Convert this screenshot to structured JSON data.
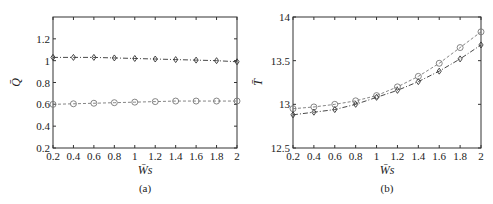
{
  "chart_data": [
    {
      "type": "line",
      "panel": "(a)",
      "caption": "(a)",
      "title": "",
      "xlabel": "W̄s",
      "ylabel": "Q̄",
      "x": [
        0.2,
        0.4,
        0.6,
        0.8,
        1.0,
        1.2,
        1.4,
        1.6,
        1.8,
        2.0
      ],
      "xticks": [
        "0.2",
        "0.4",
        "0.6",
        "0.8",
        "1",
        "1.2",
        "1.4",
        "1.6",
        "1.8",
        "2"
      ],
      "yticks": [
        "0.2",
        "0.4",
        "0.6",
        "0.8",
        "1",
        "1.2"
      ],
      "xlim": [
        0.2,
        2.0
      ],
      "ylim": [
        0.2,
        1.4
      ],
      "grid": false,
      "legend": null,
      "series": [
        {
          "name": "diamond (dash-dot)",
          "marker": "diamond",
          "line": "dash-dot",
          "values": [
            1.03,
            1.03,
            1.03,
            1.025,
            1.02,
            1.015,
            1.01,
            1.005,
            1.0,
            0.99
          ]
        },
        {
          "name": "circle (dashed)",
          "marker": "circle",
          "line": "dashed",
          "values": [
            0.6,
            0.605,
            0.61,
            0.615,
            0.62,
            0.625,
            0.63,
            0.63,
            0.63,
            0.63
          ]
        }
      ]
    },
    {
      "type": "line",
      "panel": "(b)",
      "caption": "(b)",
      "title": "",
      "xlabel": "W̄s",
      "ylabel": "T̄",
      "x": [
        0.2,
        0.4,
        0.6,
        0.8,
        1.0,
        1.2,
        1.4,
        1.6,
        1.8,
        2.0
      ],
      "xticks": [
        "0.2",
        "0.4",
        "0.6",
        "0.8",
        "1",
        "1.2",
        "1.4",
        "1.6",
        "1.8",
        "2"
      ],
      "yticks": [
        "12.5",
        "13",
        "13.5",
        "14"
      ],
      "xlim": [
        0.2,
        2.0
      ],
      "ylim": [
        12.5,
        14.0
      ],
      "grid": false,
      "legend": null,
      "series": [
        {
          "name": "circle (dashed)",
          "marker": "circle",
          "line": "dashed",
          "values": [
            12.95,
            12.97,
            13.0,
            13.04,
            13.1,
            13.2,
            13.32,
            13.47,
            13.65,
            13.83
          ]
        },
        {
          "name": "diamond (dash-dot)",
          "marker": "diamond",
          "line": "dash-dot",
          "values": [
            12.88,
            12.91,
            12.94,
            13.0,
            13.08,
            13.16,
            13.26,
            13.38,
            13.52,
            13.68
          ]
        }
      ]
    }
  ]
}
